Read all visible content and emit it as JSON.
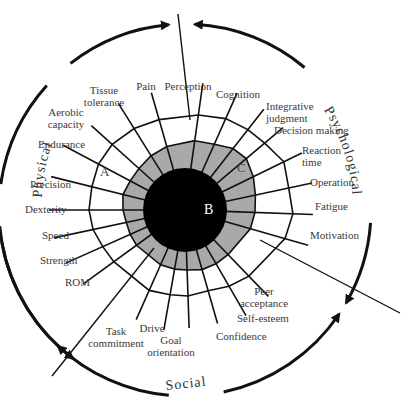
{
  "diagram": {
    "center": {
      "x": 185,
      "y": 210
    },
    "outer_circle_radius": 186,
    "inner_disk_radius": 42,
    "colors": {
      "line": "#111111",
      "gray_fill": "#a9a9a9",
      "disk": "#000000",
      "text": "#3a3a3a"
    },
    "domains": [
      {
        "label": "Physical"
      },
      {
        "label": "Psychological"
      },
      {
        "label": "Social"
      }
    ],
    "regions": [
      {
        "label": "A",
        "x": 100,
        "y": 172
      },
      {
        "label": "B",
        "x": 205,
        "y": 204
      },
      {
        "label": "C",
        "x": 238,
        "y": 165
      }
    ],
    "spokes": [
      {
        "label": "Perception",
        "angle": -82,
        "gray": 70,
        "outer": 96,
        "tip": 128
      },
      {
        "label": "Cognition",
        "angle": -66,
        "gray": 72,
        "outer": 100,
        "tip": 128
      },
      {
        "label": "Integrative\njudgment",
        "angle": -52,
        "gray": 78,
        "outer": 102,
        "tip": 128
      },
      {
        "label": "Decision making",
        "angle": -40,
        "gray": 80,
        "outer": 104,
        "tip": 128
      },
      {
        "label": "Reaction\ntime",
        "angle": -26,
        "gray": 76,
        "outer": 110,
        "tip": 130
      },
      {
        "label": "Operation",
        "angle": -12,
        "gray": 72,
        "outer": 106,
        "tip": 130
      },
      {
        "label": "Fatigue",
        "angle": 2,
        "gray": 70,
        "outer": 108,
        "tip": 128
      },
      {
        "label": "Motivation",
        "angle": 16,
        "gray": 68,
        "outer": 104,
        "tip": 128
      },
      {
        "label": "Peer\nacceptance",
        "angle": 46,
        "gray": 62,
        "outer": 92,
        "tip": 120
      },
      {
        "label": "Self-esteem",
        "angle": 60,
        "gray": 62,
        "outer": 88,
        "tip": 122
      },
      {
        "label": "Confidence",
        "angle": 74,
        "gray": 62,
        "outer": 84,
        "tip": 118
      },
      {
        "label": "Goal\norientation",
        "angle": 88,
        "gray": 60,
        "outer": 86,
        "tip": 118
      },
      {
        "label": "Drive",
        "angle": 100,
        "gray": 60,
        "outer": 86,
        "tip": 122
      },
      {
        "label": "Task\ncommitment",
        "angle": 114,
        "gray": 60,
        "outer": 88,
        "tip": 120
      },
      {
        "label": "ROM",
        "angle": 144,
        "gray": 60,
        "outer": 88,
        "tip": 126
      },
      {
        "label": "Strength",
        "angle": 156,
        "gray": 60,
        "outer": 90,
        "tip": 130
      },
      {
        "label": "Speed",
        "angle": 168,
        "gray": 60,
        "outer": 94,
        "tip": 134
      },
      {
        "label": "Dexterity",
        "angle": 180,
        "gray": 62,
        "outer": 96,
        "tip": 136
      },
      {
        "label": "Precision",
        "angle": 194,
        "gray": 64,
        "outer": 96,
        "tip": 138
      },
      {
        "label": "Endurance",
        "angle": 208,
        "gray": 62,
        "outer": 98,
        "tip": 138
      },
      {
        "label": "Aerobic\ncapacity",
        "angle": 222,
        "gray": 62,
        "outer": 98,
        "tip": 126
      },
      {
        "label": "Tissue\ntolerance",
        "angle": 238,
        "gray": 64,
        "outer": 96,
        "tip": 126
      },
      {
        "label": "Pain",
        "angle": 254,
        "gray": 66,
        "outer": 94,
        "tip": 122
      }
    ],
    "labels": [
      {
        "text": "Perception",
        "x": 188,
        "y": 80,
        "align": "center"
      },
      {
        "text": "Cognition",
        "x": 238,
        "y": 88,
        "align": "center"
      },
      {
        "text": "Integrative\njudgment",
        "x": 266,
        "y": 100,
        "align": "right"
      },
      {
        "text": "Decision making",
        "x": 274,
        "y": 124,
        "align": "right"
      },
      {
        "text": "Reaction\ntime",
        "x": 302,
        "y": 144,
        "align": "right"
      },
      {
        "text": "Operation",
        "x": 310,
        "y": 176,
        "align": "right"
      },
      {
        "text": "Fatigue",
        "x": 315,
        "y": 200,
        "align": "right"
      },
      {
        "text": "Motivation",
        "x": 310,
        "y": 229,
        "align": "right"
      },
      {
        "text": "Peer\nacceptance",
        "x": 264,
        "y": 285,
        "align": "center"
      },
      {
        "text": "Self-esteem",
        "x": 237,
        "y": 312,
        "align": "right"
      },
      {
        "text": "Confidence",
        "x": 216,
        "y": 330,
        "align": "right"
      },
      {
        "text": "Goal\norientation",
        "x": 171,
        "y": 334,
        "align": "center"
      },
      {
        "text": "Drive",
        "x": 152,
        "y": 322,
        "align": "center"
      },
      {
        "text": "Task\ncommitment",
        "x": 116,
        "y": 325,
        "align": "center"
      },
      {
        "text": "ROM",
        "x": 65,
        "y": 276,
        "align": "left"
      },
      {
        "text": "Strength",
        "x": 40,
        "y": 254,
        "align": "left"
      },
      {
        "text": "Speed",
        "x": 42,
        "y": 229,
        "align": "left"
      },
      {
        "text": "Dexterity",
        "x": 25,
        "y": 203,
        "align": "left"
      },
      {
        "text": "Precision",
        "x": 30,
        "y": 178,
        "align": "left"
      },
      {
        "text": "Endurance",
        "x": 38,
        "y": 138,
        "align": "left"
      },
      {
        "text": "Aerobic\ncapacity",
        "x": 66,
        "y": 106,
        "align": "center"
      },
      {
        "text": "Tissue\ntolerance",
        "x": 104,
        "y": 84,
        "align": "center"
      },
      {
        "text": "Pain",
        "x": 146,
        "y": 80,
        "align": "center"
      }
    ],
    "divider_lines": [
      {
        "x1": 178,
        "y1": 14,
        "x2": 190,
        "y2": 120
      },
      {
        "x1": 52,
        "y1": 376,
        "x2": 154,
        "y2": 248
      },
      {
        "x1": 260,
        "y1": 240,
        "x2": 400,
        "y2": 313
      }
    ]
  }
}
